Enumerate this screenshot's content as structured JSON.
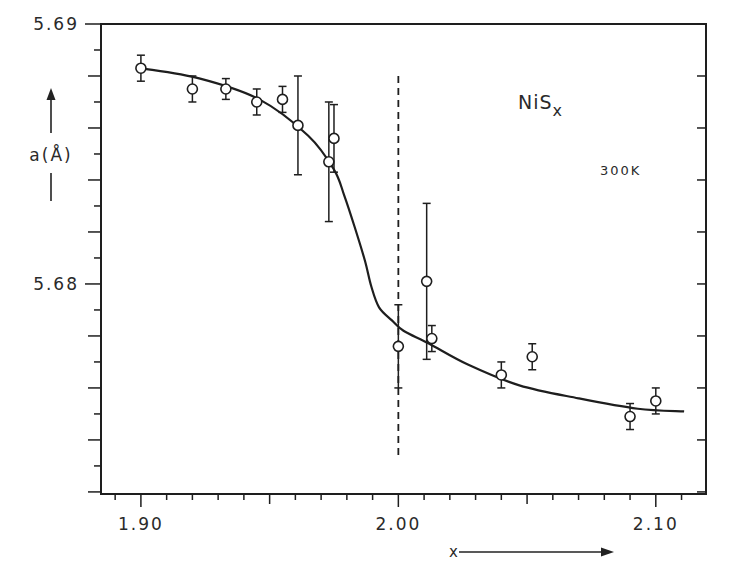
{
  "chart_data": {
    "type": "scatter",
    "title": "",
    "xlabel": "x",
    "ylabel": "a(Å)",
    "xlim": [
      1.8845,
      2.1195
    ],
    "ylim": [
      5.67192,
      5.69
    ],
    "grid": false,
    "x_ticks_major": [
      1.9,
      2.0,
      2.1
    ],
    "x_tick_labels": [
      "1.90",
      "2.00",
      "2.10"
    ],
    "x_ticks_minor_step": 0.01,
    "y_ticks_major": [
      5.68,
      5.69
    ],
    "y_tick_labels": [
      "5.68",
      "5.69"
    ],
    "y_ticks_minor_step": 0.002,
    "annotations": [
      {
        "text": "NiS",
        "subscript": "x",
        "x": 2.075,
        "y": 5.6876
      },
      {
        "text": "300K",
        "x": 2.082,
        "y": 5.6846
      }
    ],
    "reference_line": {
      "x": 2.0,
      "style": "dashed",
      "y_from": 5.688,
      "y_to": 5.6733
    },
    "series": [
      {
        "name": "NiSx lattice parameter a",
        "marker": "open-circle",
        "points": [
          {
            "x": 1.9,
            "y": 5.6883,
            "err": 0.0005
          },
          {
            "x": 1.92,
            "y": 5.6875,
            "err": 0.0005
          },
          {
            "x": 1.933,
            "y": 5.6875,
            "err": 0.0004
          },
          {
            "x": 1.945,
            "y": 5.687,
            "err": 0.0005
          },
          {
            "x": 1.955,
            "y": 5.6871,
            "err": 0.0005
          },
          {
            "x": 1.961,
            "y": 5.6861,
            "err": 0.0019
          },
          {
            "x": 1.973,
            "y": 5.6847,
            "err": 0.0023
          },
          {
            "x": 1.975,
            "y": 5.6856,
            "err": 0.0013
          },
          {
            "x": 2.0,
            "y": 5.6776,
            "err": 0.0016
          },
          {
            "x": 2.011,
            "y": 5.6801,
            "err": 0.003
          },
          {
            "x": 2.013,
            "y": 5.6779,
            "err": 0.0005
          },
          {
            "x": 2.04,
            "y": 5.6765,
            "err": 0.0005
          },
          {
            "x": 2.052,
            "y": 5.6772,
            "err": 0.0005
          },
          {
            "x": 2.09,
            "y": 5.6749,
            "err": 0.0005
          },
          {
            "x": 2.1,
            "y": 5.6755,
            "err": 0.0005
          }
        ]
      },
      {
        "name": "guide curve",
        "type": "line",
        "x": [
          1.9,
          1.923,
          1.946,
          1.965,
          1.975,
          1.979,
          1.983,
          1.987,
          1.9895,
          1.9925,
          1.9975,
          2.002,
          2.012,
          2.027,
          2.047,
          2.07,
          2.093,
          2.111
        ],
        "y": [
          5.6883,
          5.6879,
          5.6871,
          5.6857,
          5.6844,
          5.6834,
          5.6822,
          5.6809,
          5.6799,
          5.6791,
          5.6786,
          5.6782,
          5.6777,
          5.6769,
          5.6761,
          5.6756,
          5.6752,
          5.6751
        ]
      }
    ]
  },
  "labels": {
    "y_axis_label": "a(Å)",
    "x_axis_label": "x",
    "compound": "NiS",
    "compound_subscript": "x",
    "temperature": "300K"
  }
}
